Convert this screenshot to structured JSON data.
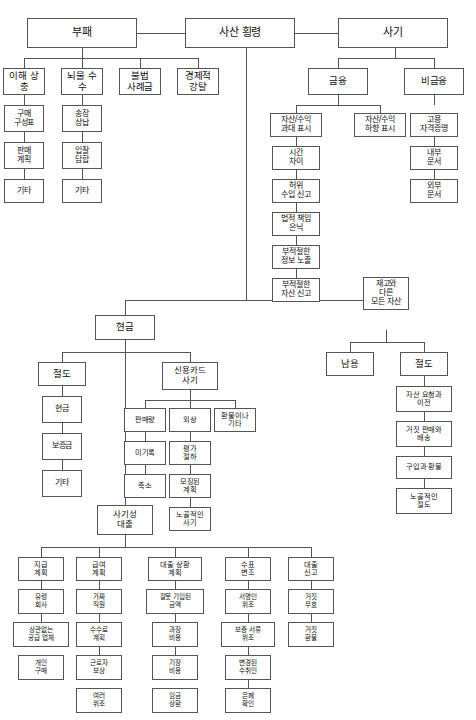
{
  "diagram": {
    "title": "사산 횡령",
    "type": "tree-diagram",
    "language": "ko",
    "colors": {
      "box_border": "#555555",
      "box_fill": "#ffffff",
      "line": "#555555",
      "text": "#111111",
      "background": "#ffffff"
    },
    "nodes": {
      "root": "사산 횡령",
      "corruption": "부패",
      "fraud": "사기",
      "conflict_of_interest": "이해 상충",
      "bribery": "뇌물 수수",
      "illegal_gratuities": "불법\n사례금",
      "economic_extortion": "경제적\n강탈",
      "purchase_schemes": "구매\n구성표",
      "sales_schemes": "판매\n계획",
      "corruption_other_1": "기타",
      "invoice_kickbacks": "송장\n상납",
      "bid_rigging": "입찰\n담합",
      "corruption_other_2": "기타",
      "financial": "금융",
      "non_financial": "비금융",
      "asset_revenue_overstated": "자산/수익\n과대 표시",
      "asset_revenue_understated": "자산/수익\n하향 표시",
      "timing_differences": "시간\n차이",
      "fictitious_revenues": "허위\n수입 신고",
      "concealed_liabilities": "법적 책임\n은닉",
      "improper_disclosures": "부적절한\n정보 노출",
      "improper_asset_valuation": "부적절한\n자산 신고",
      "employment_credentials": "고용\n자격증명",
      "internal_documents": "내부\n문서",
      "external_documents": "외부\n문서",
      "cash": "현금",
      "inventory_other_assets": "재고와\n다른\n모든 자산",
      "cash_theft": "절도",
      "credit_card_fraud": "신용카드\n사기",
      "fraudulent_disbursements": "사기성\n대출",
      "misuse": "남용",
      "asset_theft": "절도",
      "theft_cash": "현금",
      "theft_deposit": "보증금",
      "theft_other": "기타",
      "sales_volume": "판매량",
      "unrecorded": "미기록",
      "understated": "축소",
      "receivables": "외상",
      "write_off": "평가\n절하",
      "lapping": "모징된\n계획",
      "unconcealed": "노골적인\n사기",
      "refunds_other": "환불이나\n기타",
      "asset_req_transfer": "자산 요청과\n이전",
      "false_sales_shipping": "거짓 판매와\n배송",
      "purchasing_receiving": "구입과 환불",
      "unconcealed_larceny": "노골적인\n절도",
      "billing_schemes": "지급\n계획",
      "payroll_schemes": "급여\n계획",
      "expense_reimbursement": "대출 상환\n계획",
      "check_tampering": "수표\n변조",
      "register_disbursements": "대출\n신고",
      "shell_company": "유령\n회사",
      "non_accomplice_vendor": "상관없는\n공급 업체",
      "personal_purchases": "개인\n구매",
      "ghost_employees": "가짜\n직원",
      "commission_schemes": "수수료\n계획",
      "workers_compensation": "근로자\n보상",
      "falsified_wages": "여러\n위조",
      "mischaracterized": "잘못 기입된\n금액",
      "overstated_expenses": "과장\n비용",
      "fictitious_expenses": "기장\n비용",
      "multiple_reimbursements": "임금\n상환",
      "forged_maker": "서명인\n위조",
      "forged_endorsement": "보증 서류\n위조",
      "altered_payee": "변경된\n수취인",
      "concealed_checks": "은폐\n확인",
      "authorized_maker": "공식\n확인",
      "false_voids": "거짓\n무효",
      "false_refunds": "거짓\n환불"
    }
  }
}
